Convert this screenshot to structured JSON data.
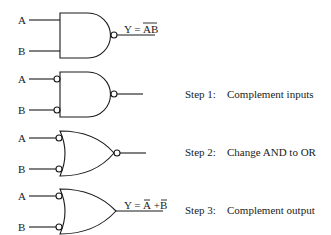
{
  "diagram": {
    "inputs": [
      "A",
      "B"
    ],
    "gates": [
      {
        "id": "nand",
        "type": "NAND",
        "output_label": "Y = AB",
        "output_overbar": "AB"
      },
      {
        "id": "step1",
        "type": "NAND with inverted inputs",
        "output_label": ""
      },
      {
        "id": "step2",
        "type": "NOR with inverted inputs",
        "output_label": ""
      },
      {
        "id": "step3",
        "type": "OR with inverted inputs",
        "output_label": "Y = A + B"
      }
    ],
    "steps": [
      {
        "num": "Step 1:",
        "text": "Complement inputs"
      },
      {
        "num": "Step 2:",
        "text": "Change AND to OR"
      },
      {
        "num": "Step 3:",
        "text": "Complement output"
      }
    ],
    "labels": {
      "a": "A",
      "b": "B",
      "y1_prefix": "Y = ",
      "y1_term": "AB",
      "y4_prefix": "Y = ",
      "y4_a": "A",
      "y4_plus": " + ",
      "y4_b": "B"
    }
  }
}
